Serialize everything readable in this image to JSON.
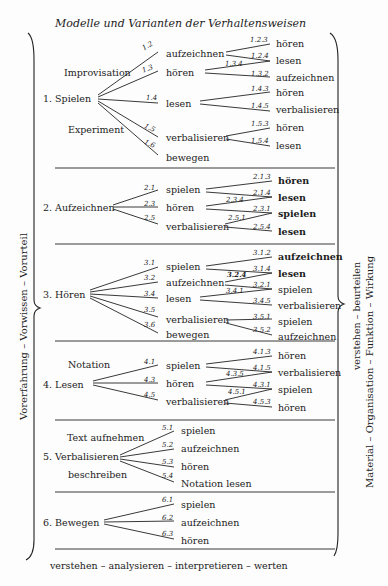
{
  "title": "Modelle und Varianten der Verhaltensweisen",
  "left_label": "Vorerfahrung  –  Vorwissen  –  Vorurteil",
  "right_label_top": "verstehen  –  beurteilen",
  "right_label_bottom": "Material  –  Organisation  –  Funktion  –  Wirkung",
  "footer": "verstehen  –  analysieren  –  interpretieren  –  werten",
  "sections": [
    {
      "label": "1. Spielen",
      "sublabels": [
        "Improvisation",
        "Experiment"
      ],
      "branches": [
        {
          "code": "1.2",
          "label": "aufzeichnen"
        },
        {
          "code": "1.3",
          "label": "hören"
        },
        {
          "code": "1.4",
          "label": "lesen"
        },
        {
          "code": "1.5",
          "label": "verbalisieren"
        },
        {
          "code": "1.6",
          "label": "bewegen"
        }
      ],
      "leaves": [
        {
          "code": "1.2.3",
          "label": "hören"
        },
        {
          "code": "1.2.4",
          "label": "lesen"
        },
        {
          "code": "1.3.4",
          "label": ""
        },
        {
          "code": "1.3.2",
          "label": "aufzeichnen"
        },
        {
          "code": "1.4.3",
          "label": "hören"
        },
        {
          "code": "1.4.5",
          "label": "verbalisieren"
        },
        {
          "code": "1.5.3",
          "label": "hören"
        },
        {
          "code": "1.5.4",
          "label": "lesen"
        }
      ]
    },
    {
      "label": "2. Aufzeichnen",
      "branches": [
        {
          "code": "2.1",
          "label": "spielen"
        },
        {
          "code": "2.3",
          "label": "hören"
        },
        {
          "code": "2.5",
          "label": "verbalisieren"
        }
      ],
      "leaves": [
        {
          "code": "2.1.3",
          "label": "hören"
        },
        {
          "code": "2.1.4",
          "label": "lesen"
        },
        {
          "code": "2.3.4",
          "label": ""
        },
        {
          "code": "2.3.1",
          "label": "spielen"
        },
        {
          "code": "2.5.1",
          "label": ""
        },
        {
          "code": "2.5.4",
          "label": "lesen"
        }
      ]
    },
    {
      "label": "3. Hören",
      "branches": [
        {
          "code": "3.1",
          "label": "spielen"
        },
        {
          "code": "3.2",
          "label": "aufzeichnen"
        },
        {
          "code": "3.4",
          "label": "lesen"
        },
        {
          "code": "3.5",
          "label": "verbalisieren"
        },
        {
          "code": "3.6",
          "label": "bewegen"
        }
      ],
      "leaves": [
        {
          "code": "3.1.2",
          "label": "aufzeichnen"
        },
        {
          "code": "3.1.4",
          "label": "lesen"
        },
        {
          "code": "3.2.4",
          "label": ""
        },
        {
          "code": "3.2.1",
          "label": "spielen"
        },
        {
          "code": "3.4.1",
          "label": ""
        },
        {
          "code": "3.4.5",
          "label": "verbalisieren"
        },
        {
          "code": "3.5.1",
          "label": "spielen"
        },
        {
          "code": "3.5.2",
          "label": "aufzeichnen"
        }
      ]
    },
    {
      "label": "4. Lesen",
      "sublabels": [
        "Notation"
      ],
      "branches": [
        {
          "code": "4.1",
          "label": "spielen"
        },
        {
          "code": "4.3",
          "label": "hören"
        },
        {
          "code": "4.5",
          "label": "verbalisieren"
        }
      ],
      "leaves": [
        {
          "code": "4.1.3",
          "label": "hören"
        },
        {
          "code": "4.1.5",
          "label": "verbalisieren"
        },
        {
          "code": "4.3.5",
          "label": ""
        },
        {
          "code": "4.3.1",
          "label": "spielen"
        },
        {
          "code": "4.5.1",
          "label": ""
        },
        {
          "code": "4.5.3",
          "label": "hören"
        }
      ]
    },
    {
      "label": "5. Verbalisieren",
      "sublabels": [
        "Text aufnehmen",
        "beschreiben"
      ],
      "branches": [
        {
          "code": "5.1",
          "label": "spielen"
        },
        {
          "code": "5.2",
          "label": "aufzeichnen"
        },
        {
          "code": "5.3",
          "label": "hören"
        },
        {
          "code": "5.4",
          "label": "Notation lesen"
        }
      ]
    },
    {
      "label": "6. Bewegen",
      "branches": [
        {
          "code": "6.1",
          "label": "spielen"
        },
        {
          "code": "6.2",
          "label": "aufzeichnen"
        },
        {
          "code": "6.3",
          "label": "hören"
        }
      ]
    }
  ]
}
